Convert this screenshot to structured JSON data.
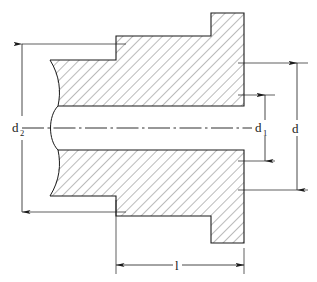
{
  "figure": {
    "type": "engineering-cross-section",
    "line_color": "#1a1a1a",
    "hatch_color": "#555555",
    "background": "#ffffff"
  },
  "labels": {
    "d2": {
      "base": "d",
      "subscript": "2"
    },
    "d1": {
      "base": "d",
      "subscript": "1"
    },
    "d": {
      "base": "d",
      "subscript": ""
    },
    "l": {
      "base": "l",
      "subscript": ""
    }
  },
  "dimensions": [
    {
      "name": "d2",
      "orientation": "vertical",
      "side": "left",
      "label": "d",
      "subscript": "2",
      "arrows": "both"
    },
    {
      "name": "d1",
      "orientation": "vertical",
      "side": "right",
      "label": "d",
      "subscript": "1",
      "arrows": "both"
    },
    {
      "name": "d",
      "orientation": "vertical",
      "side": "far-right",
      "label": "d",
      "subscript": "",
      "arrows": "both"
    },
    {
      "name": "l",
      "orientation": "horizontal",
      "side": "bottom",
      "label": "l",
      "subscript": "",
      "arrows": "both"
    }
  ],
  "geometry": {
    "centerline_style": "dash-dot",
    "break_line_style": "freehand-s-curve",
    "hatch_angle_deg": 45,
    "hatch_spacing_px": 7
  }
}
